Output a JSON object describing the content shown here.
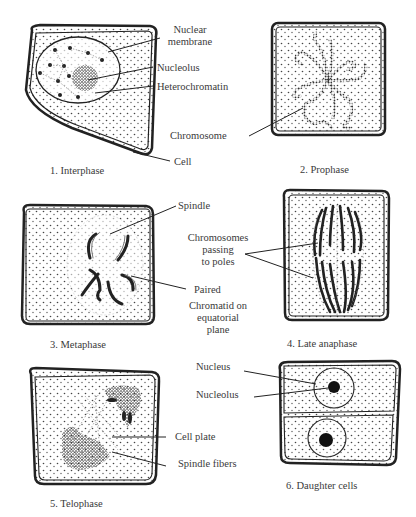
{
  "figure": {
    "panels": [
      {
        "caption": "1. Interphase",
        "labels": [
          "Nuclear membrane",
          "Nucleolus",
          "Heterochromatin",
          "Cell"
        ],
        "label_lines": {
          "nuclear_membrane_1": "Nuclear",
          "nuclear_membrane_2": "membrane"
        }
      },
      {
        "caption": "2. Prophase",
        "labels": [
          "Chromosome"
        ]
      },
      {
        "caption": "3. Metaphase",
        "labels": [
          "Spindle",
          "Paired",
          "Chromatid on equatorial plane"
        ],
        "label_lines": {
          "chromatid_1": "Chromatid on",
          "chromatid_2": "equatorial",
          "chromatid_3": "plane"
        }
      },
      {
        "caption": "4. Late anaphase",
        "labels": [
          "Chromosomes passing to poles"
        ],
        "label_lines": {
          "line_1": "Chromosomes",
          "line_2": "passing",
          "line_3": "to poles"
        }
      },
      {
        "caption": "5. Telophase",
        "labels": [
          "Cell plate",
          "Spindle fibers"
        ]
      },
      {
        "caption": "6. Daughter cells",
        "labels": [
          "Nucleus",
          "Nucleolus"
        ]
      }
    ]
  }
}
